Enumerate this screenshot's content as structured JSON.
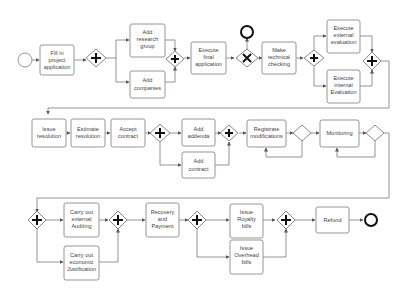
{
  "diagram": {
    "type": "BPMN process",
    "events": {
      "start": {
        "label": ""
      },
      "end_reject": {
        "label": ""
      },
      "end_final": {
        "label": ""
      }
    },
    "tasks": [
      {
        "id": "t1",
        "lines": [
          "Fill in",
          "project",
          "application"
        ]
      },
      {
        "id": "t2",
        "lines": [
          "Add",
          "research",
          "group"
        ]
      },
      {
        "id": "t3",
        "lines": [
          "Add",
          "companies"
        ]
      },
      {
        "id": "t4",
        "lines": [
          "Execute",
          "final",
          "application"
        ]
      },
      {
        "id": "t5",
        "lines": [
          "Make",
          "technical",
          "checking"
        ]
      },
      {
        "id": "t6",
        "lines": [
          "Execute",
          "external",
          "evaluation"
        ]
      },
      {
        "id": "t7",
        "lines": [
          "Execute",
          "internal",
          "Evaluation"
        ]
      },
      {
        "id": "t8",
        "lines": [
          "Issue",
          "resolution"
        ]
      },
      {
        "id": "t9",
        "lines": [
          "Estimate",
          "resolution"
        ]
      },
      {
        "id": "t10",
        "lines": [
          "Accept",
          "contract"
        ]
      },
      {
        "id": "t11",
        "lines": [
          "Add",
          "addenda"
        ]
      },
      {
        "id": "t12",
        "lines": [
          "Add",
          "contract"
        ]
      },
      {
        "id": "t13",
        "lines": [
          "Registrate",
          "modifications"
        ]
      },
      {
        "id": "t14",
        "lines": [
          "Monitoring"
        ]
      },
      {
        "id": "t15",
        "lines": [
          "Carry out",
          "external",
          "Auditing"
        ]
      },
      {
        "id": "t16",
        "lines": [
          "Carry out",
          "economic",
          "Justification"
        ]
      },
      {
        "id": "t17",
        "lines": [
          "Recovery",
          "and",
          "Payment"
        ]
      },
      {
        "id": "t18",
        "lines": [
          "Issue",
          "Royalty",
          "bills"
        ]
      },
      {
        "id": "t19",
        "lines": [
          "Issue",
          "Overhead",
          "bills"
        ]
      },
      {
        "id": "t20",
        "lines": [
          "Refund"
        ]
      }
    ],
    "gateways": [
      {
        "id": "g1",
        "kind": "parallel",
        "symbol": "+"
      },
      {
        "id": "g2",
        "kind": "parallel",
        "symbol": "+"
      },
      {
        "id": "g3",
        "kind": "exclusive",
        "symbol": "X"
      },
      {
        "id": "g4",
        "kind": "parallel",
        "symbol": "+"
      },
      {
        "id": "g5",
        "kind": "parallel",
        "symbol": "+"
      },
      {
        "id": "g6",
        "kind": "parallel",
        "symbol": "+"
      },
      {
        "id": "g7",
        "kind": "parallel",
        "symbol": "+"
      },
      {
        "id": "g8",
        "kind": "empty",
        "symbol": ""
      },
      {
        "id": "g9",
        "kind": "empty",
        "symbol": ""
      },
      {
        "id": "g10",
        "kind": "parallel",
        "symbol": "+"
      },
      {
        "id": "g11",
        "kind": "parallel",
        "symbol": "+"
      },
      {
        "id": "g12",
        "kind": "parallel",
        "symbol": "+"
      },
      {
        "id": "g13",
        "kind": "parallel",
        "symbol": "+"
      }
    ]
  }
}
